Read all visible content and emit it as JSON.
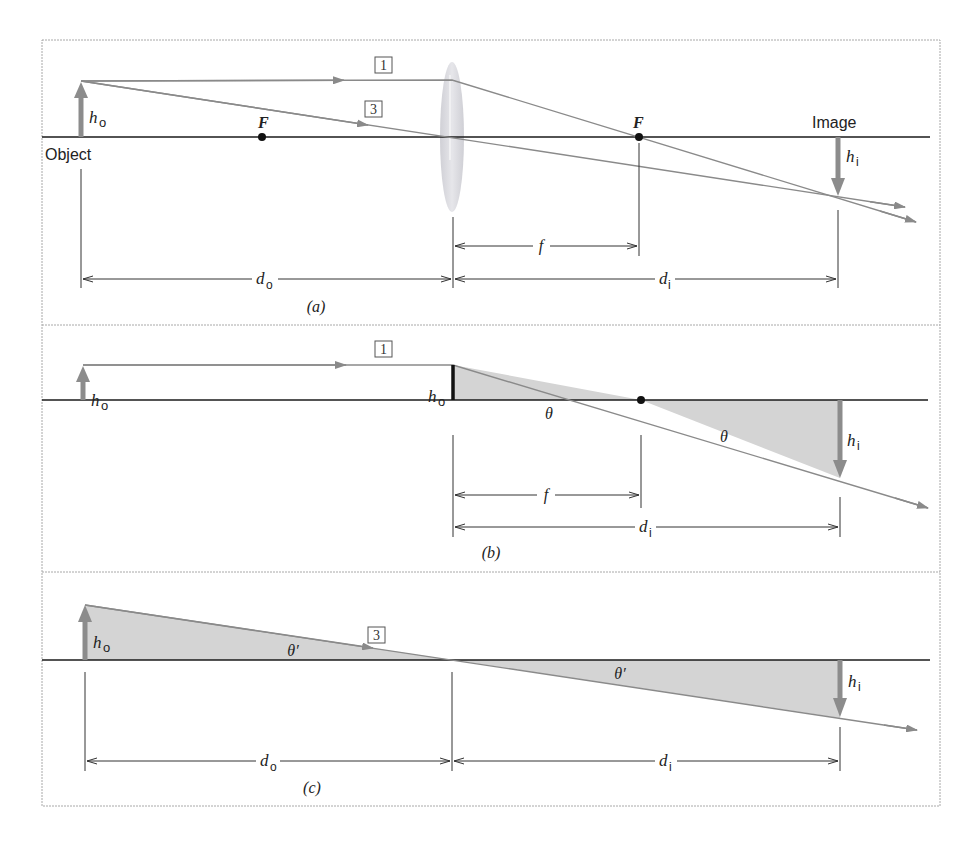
{
  "figure": {
    "colors": {
      "panel_border": "#a8a8a8",
      "axis": "#1a1a1a",
      "ray": "#8a8a8a",
      "object_arrow": "#8c8c8c",
      "lens": "#d8d8de",
      "shade": "#d4d4d4",
      "dim_line": "#333333",
      "focal_point": "#111111"
    },
    "panels": [
      {
        "id": "a",
        "caption": "(a)",
        "labels": {
          "object": "Object",
          "image": "Image",
          "ho": "h",
          "ho_sub": "o",
          "hi": "h",
          "hi_sub": "i",
          "focal_left": "F",
          "focal_right": "F",
          "ray1": "1",
          "ray3": "3",
          "f": "f",
          "do": "d",
          "do_sub": "o",
          "di": "d",
          "di_sub": "i"
        }
      },
      {
        "id": "b",
        "caption": "(b)",
        "labels": {
          "ho": "h",
          "ho_sub": "o",
          "ho_lens": "h",
          "ho_lens_sub": "o",
          "hi": "h",
          "hi_sub": "i",
          "theta_left": "θ",
          "theta_right": "θ",
          "ray1": "1",
          "f": "f",
          "di": "d",
          "di_sub": "i"
        }
      },
      {
        "id": "c",
        "caption": "(c)",
        "labels": {
          "ho": "h",
          "ho_sub": "o",
          "hi": "h",
          "hi_sub": "i",
          "theta_left": "θ′",
          "theta_right": "θ′",
          "ray3": "3",
          "do": "d",
          "do_sub": "o",
          "di": "d",
          "di_sub": "i"
        }
      }
    ]
  }
}
